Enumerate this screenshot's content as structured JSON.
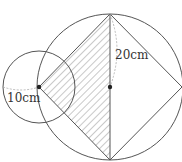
{
  "diagram": {
    "type": "geometry",
    "labels": {
      "small_radius": "10cm",
      "large_radius": "20cm"
    },
    "colors": {
      "stroke": "#555555",
      "hatch": "#777777",
      "dim_line": "#aaaaaa",
      "point": "#222222"
    },
    "shapes": {
      "large_circle": {
        "cx": 110,
        "cy": 87,
        "r": 73
      },
      "small_circle": {
        "cx": 39,
        "cy": 87,
        "r": 36
      },
      "square_vertices": [
        [
          110,
          14
        ],
        [
          182,
          87
        ],
        [
          110,
          160
        ],
        [
          39,
          87
        ]
      ],
      "shaded_triangle": [
        [
          110,
          14
        ],
        [
          110,
          160
        ],
        [
          39,
          87
        ]
      ]
    }
  }
}
